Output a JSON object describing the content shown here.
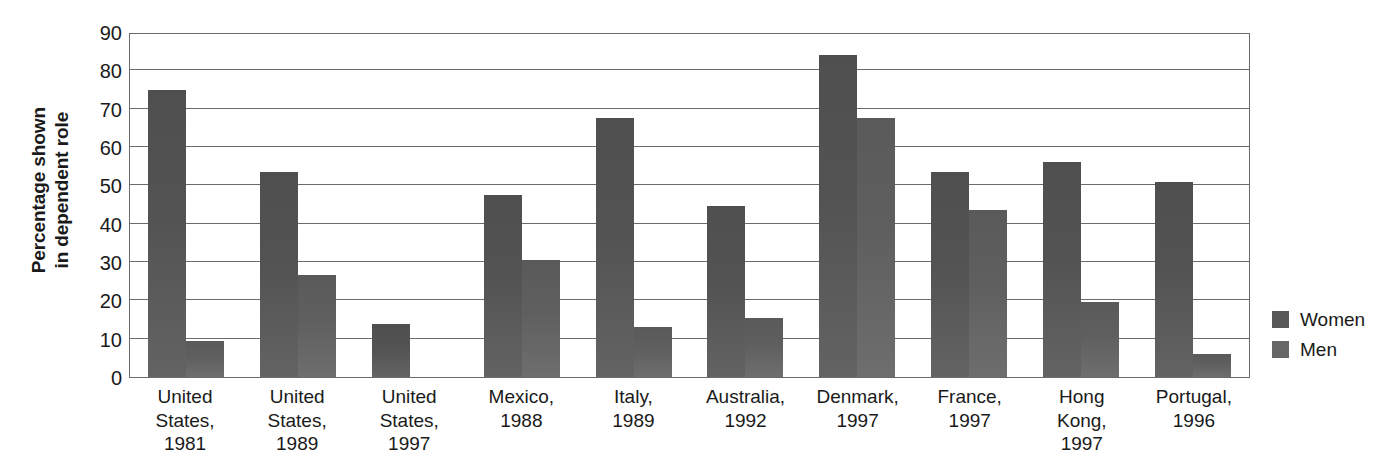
{
  "chart_data": {
    "type": "bar",
    "title": "",
    "xlabel": "",
    "ylabel": "Percentage shown in dependent role",
    "ylim": [
      0,
      90
    ],
    "yticks": [
      0,
      10,
      20,
      30,
      40,
      50,
      60,
      70,
      80,
      90
    ],
    "grid": true,
    "legend_position": "right",
    "categories": [
      "United States, 1981",
      "United States, 1989",
      "United States, 1997",
      "Mexico, 1988",
      "Italy, 1989",
      "Australia, 1992",
      "Denmark, 1997",
      "France, 1997",
      "Hong Kong, 1997",
      "Portugal, 1996"
    ],
    "category_lines": [
      [
        "United",
        "States,",
        "1981"
      ],
      [
        "United",
        "States,",
        "1989"
      ],
      [
        "United",
        "States,",
        "1997"
      ],
      [
        "Mexico,",
        "1988"
      ],
      [
        "Italy,",
        "1989"
      ],
      [
        "Australia,",
        "1992"
      ],
      [
        "Denmark,",
        "1997"
      ],
      [
        "France,",
        "1997"
      ],
      [
        "Hong",
        "Kong,",
        "1997"
      ],
      [
        "Portugal,",
        "1996"
      ]
    ],
    "series": [
      {
        "name": "Women",
        "color": "#585858",
        "values": [
          75,
          53.5,
          13.8,
          47.5,
          67.5,
          44.5,
          84,
          53.5,
          56,
          51
        ]
      },
      {
        "name": "Men",
        "color": "#676767",
        "values": [
          9.5,
          26.5,
          null,
          30.5,
          13,
          15.5,
          67.5,
          43.5,
          19.5,
          6
        ]
      }
    ]
  },
  "axis": {
    "ylabel_line1": "Percentage shown",
    "ylabel_line2": "in dependent role"
  },
  "legend": {
    "items": [
      {
        "label": "Women",
        "swatch": "women-swatch"
      },
      {
        "label": "Men",
        "swatch": "men-swatch"
      }
    ]
  }
}
